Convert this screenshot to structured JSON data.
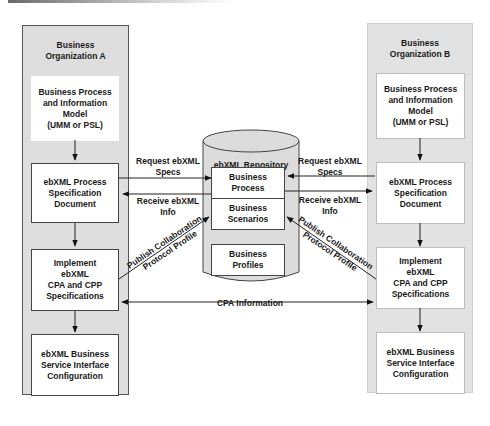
{
  "org_a": {
    "title": "Business\nOrganization A",
    "boxes": [
      "Business Process\nand Information\nModel\n(UMM or PSL)",
      "ebXML Process\nSpecification\nDocument",
      "Implement\nebXML\nCPA and CPP\nSpecifications",
      "ebXML Business\nService Interface\nConfiguration"
    ]
  },
  "org_b": {
    "title": "Business\nOrganization B",
    "boxes": [
      "Business Process\nand Information\nModel\n(UMM or PSL)",
      "ebXML Process\nSpecification\nDocument",
      "Implement\nebXML\nCPA and CPP\nSpecifications",
      "ebXML Business\nService Interface\nConfiguration"
    ]
  },
  "repository": {
    "title": "ebXML Repository",
    "items": [
      "Business\nProcess",
      "Business\nScenarios",
      "Business\nProfiles"
    ]
  },
  "connectors": {
    "request_left": "Request ebXML\nSpecs",
    "receive_left": "Receive ebXML\nInfo",
    "request_right": "Request ebXML\nSpecs",
    "receive_right": "Receive ebXML\nInfo",
    "publish_left": "Publish Collaboration\nProtocol Profile",
    "publish_right": "Publish Collaboration\nProtocol Profile",
    "cpa_information": "CPA Information"
  },
  "colors": {
    "org_fill": "#dedede",
    "box_fill": "#ffffff",
    "line": "#222222"
  }
}
